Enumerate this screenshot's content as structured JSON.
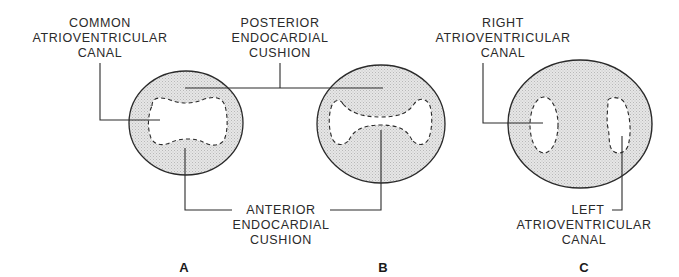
{
  "figure": {
    "panels": [
      {
        "id": "A",
        "label": "A"
      },
      {
        "id": "B",
        "label": "B"
      },
      {
        "id": "C",
        "label": "C"
      }
    ],
    "labels": {
      "common_av_canal": [
        "COMMON",
        "ATRIOVENTRICULAR",
        "CANAL"
      ],
      "posterior_cushion": [
        "POSTERIOR",
        "ENDOCARDIAL",
        "CUSHION"
      ],
      "right_av_canal": [
        "RIGHT",
        "ATRIOVENTRICULAR",
        "CANAL"
      ],
      "anterior_cushion": [
        "ANTERIOR",
        "ENDOCARDIAL",
        "CUSHION"
      ],
      "left_av_canal": [
        "LEFT",
        "ATRIOVENTRICULAR",
        "CANAL"
      ]
    },
    "colors": {
      "stroke": "#2a2a2a",
      "fill": "#dcdcdc",
      "background": "#ffffff"
    }
  }
}
